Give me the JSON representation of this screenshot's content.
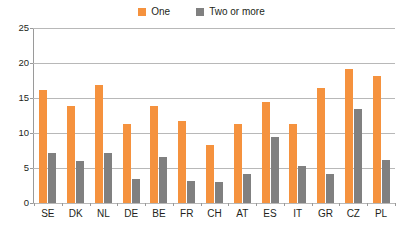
{
  "chart_data": {
    "type": "bar",
    "title": "",
    "subtitle": "",
    "xlabel": "",
    "ylabel": "",
    "ylim": [
      0,
      25
    ],
    "yticks": [
      0,
      5,
      10,
      15,
      20,
      25
    ],
    "grid": true,
    "legend_position": "top-center",
    "categories": [
      "SE",
      "DK",
      "NL",
      "DE",
      "BE",
      "FR",
      "CH",
      "AT",
      "ES",
      "IT",
      "GR",
      "CZ",
      "PL"
    ],
    "series": [
      {
        "name": "One",
        "color": "#f5923e",
        "values": [
          16.1,
          13.8,
          16.8,
          11.3,
          13.9,
          11.7,
          8.3,
          11.3,
          14.4,
          11.3,
          16.4,
          19.1,
          18.2
        ]
      },
      {
        "name": "Two or more",
        "color": "#808080",
        "values": [
          7.1,
          6.0,
          7.1,
          3.4,
          6.6,
          3.1,
          3.0,
          4.1,
          9.5,
          5.3,
          4.2,
          13.4,
          6.2
        ]
      }
    ]
  },
  "legend": {
    "items": [
      {
        "label": "One",
        "color": "#f5923e",
        "icon": "square-swatch-icon"
      },
      {
        "label": "Two or more",
        "color": "#808080",
        "icon": "square-swatch-icon"
      }
    ]
  },
  "axis": {
    "y_ticks": [
      "0",
      "5",
      "10",
      "15",
      "20",
      "25"
    ],
    "x_ticks": [
      "SE",
      "DK",
      "NL",
      "DE",
      "BE",
      "FR",
      "CH",
      "AT",
      "ES",
      "IT",
      "GR",
      "CZ",
      "PL"
    ]
  }
}
